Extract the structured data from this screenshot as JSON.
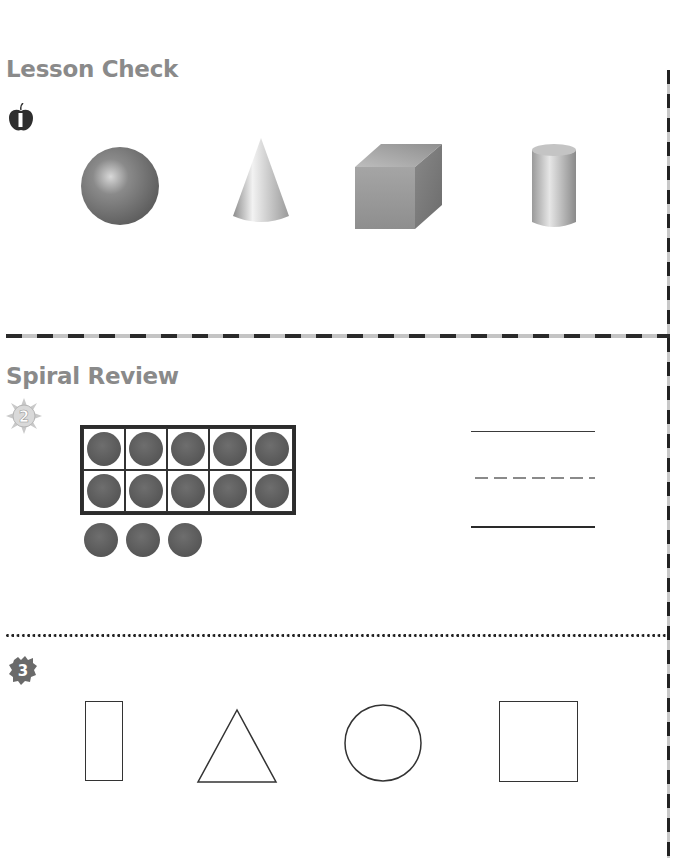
{
  "sections": [
    {
      "title": "Lesson Check",
      "problems": [
        {
          "number": "1",
          "badge_icon": "apple-icon",
          "type": "choose-shape",
          "options": [
            {
              "shape": "sphere",
              "label": "sphere"
            },
            {
              "shape": "cone",
              "label": "cone"
            },
            {
              "shape": "cube",
              "label": "cube"
            },
            {
              "shape": "cylinder",
              "label": "cylinder"
            }
          ]
        }
      ]
    },
    {
      "title": "Spiral Review",
      "problems": [
        {
          "number": "2",
          "badge_icon": "sun-icon",
          "type": "write-number",
          "ten_frame": {
            "rows": 2,
            "cols": 5,
            "filled": 10
          },
          "extra_counters": 3,
          "total_counters": 13,
          "answer_lines": [
            "top-solid",
            "middle-dashed",
            "bottom-solid"
          ]
        },
        {
          "number": "3",
          "badge_icon": "leaf-badge-icon",
          "type": "choose-shape",
          "options": [
            {
              "shape": "rectangle",
              "label": "rectangle"
            },
            {
              "shape": "triangle",
              "label": "triangle"
            },
            {
              "shape": "circle",
              "label": "circle"
            },
            {
              "shape": "square",
              "label": "square"
            }
          ]
        }
      ]
    }
  ],
  "colors": {
    "title_gray": "#8a8a8a",
    "counter": "#5a5a5a",
    "outline": "#333333",
    "divider_dark": "#2a2a2a",
    "divider_light": "#c4c4c4"
  }
}
